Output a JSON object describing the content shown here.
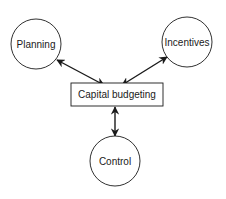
{
  "diagram": {
    "nodes": {
      "planning": {
        "label": "Planning",
        "shape": "circle"
      },
      "incentives": {
        "label": "Incentives",
        "shape": "circle"
      },
      "capital_budgeting": {
        "label": "Capital budgeting",
        "shape": "rectangle"
      },
      "control": {
        "label": "Control",
        "shape": "circle"
      }
    },
    "edges": [
      {
        "from": "capital_budgeting",
        "to": "planning",
        "type": "bidirectional-arrow"
      },
      {
        "from": "capital_budgeting",
        "to": "incentives",
        "type": "bidirectional-arrow"
      },
      {
        "from": "capital_budgeting",
        "to": "control",
        "type": "bidirectional-arrow"
      }
    ],
    "colors": {
      "stroke": "#1a1a1a",
      "background": "#ffffff"
    }
  }
}
